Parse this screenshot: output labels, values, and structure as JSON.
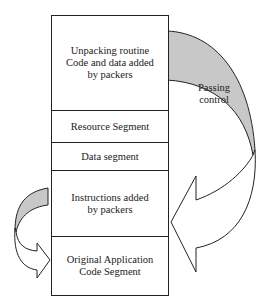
{
  "segments": [
    {
      "label": "Unpacking routine\nCode and data added\nby packers"
    },
    {
      "label": "Resource Segment"
    },
    {
      "label": "Data segment"
    },
    {
      "label": "Instructions added\nby packers"
    },
    {
      "label": "Original Application\nCode Segment"
    }
  ],
  "annotations": {
    "passing_control": "Passing\ncontrol"
  },
  "colors": {
    "arrow_fill": "#c8c8c8",
    "stroke": "#222222"
  }
}
